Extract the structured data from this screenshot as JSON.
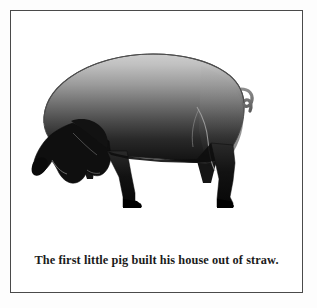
{
  "page": {
    "background_color": "#ffffff",
    "frame": {
      "border_color": "#4a4a4a",
      "fill_color": "#ffffff"
    }
  },
  "illustration": {
    "name": "pig-illustration",
    "subject": "pig",
    "pose": "side profile facing left, head lowered grazing",
    "colors": {
      "body_gradient_top": "#c9c9c9",
      "body_gradient_mid": "#7a7a7a",
      "body_gradient_bottom": "#111111",
      "legs": "#0b0b0b",
      "head": "#0d0d0d",
      "outline": "#3c3c3c",
      "highlight_line": "#9a9a9a"
    },
    "parts": [
      "body",
      "head",
      "snout",
      "ear",
      "front-leg-near",
      "front-leg-far",
      "hind-leg-near",
      "hind-leg-far",
      "hoof",
      "tail"
    ]
  },
  "caption": {
    "text": "The first little pig built his house out of straw.",
    "color": "#1b1b1b",
    "weight": "bold",
    "align": "center"
  }
}
